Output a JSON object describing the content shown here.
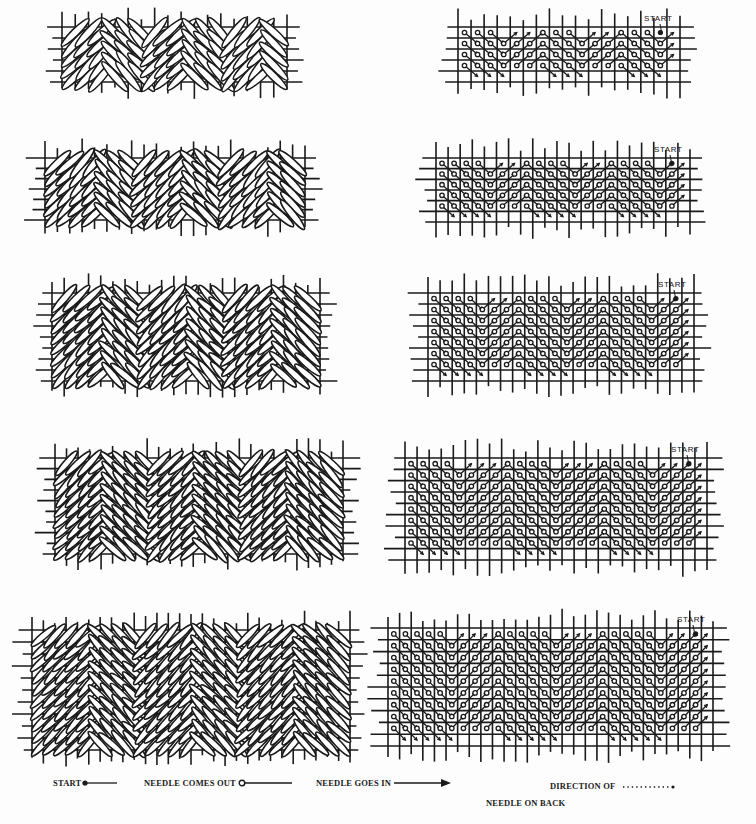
{
  "figure": {
    "title": "",
    "ink_color": "#1a1a1a",
    "paper_color": "#fdfdfd"
  },
  "panels": [
    {
      "id": "v1",
      "rows": 5,
      "cols": 17,
      "start_label": "START"
    },
    {
      "id": "v2",
      "rows": 6,
      "cols": 21,
      "start_label": "START"
    },
    {
      "id": "v3",
      "rows": 8,
      "cols": 22,
      "start_label": "START"
    },
    {
      "id": "v4",
      "rows": 9,
      "cols": 25,
      "start_label": "START"
    },
    {
      "id": "v5",
      "rows": 10,
      "cols": 28,
      "start_label": "START"
    }
  ],
  "legend": {
    "start": "START",
    "needle_out": "NEEDLE COMES OUT",
    "needle_in": "NEEDLE GOES IN",
    "direction_line1": "DIRECTION OF",
    "direction_line2": "NEEDLE ON BACK"
  }
}
